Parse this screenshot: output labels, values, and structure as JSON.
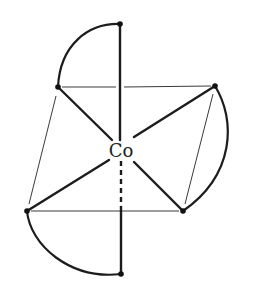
{
  "diagram": {
    "type": "octahedral coordination complex",
    "center_atom": {
      "label": "Co",
      "x": 121,
      "y": 151
    },
    "ligand_atoms": [
      {
        "id": "top",
        "x": 120,
        "y": 24
      },
      {
        "id": "upper-left",
        "x": 58,
        "y": 87
      },
      {
        "id": "upper-right",
        "x": 215,
        "y": 86
      },
      {
        "id": "lower-left",
        "x": 27,
        "y": 211
      },
      {
        "id": "lower-right",
        "x": 183,
        "y": 211
      },
      {
        "id": "bottom",
        "x": 121,
        "y": 274
      }
    ],
    "chelate_arcs": [
      {
        "from": "top",
        "to": "upper-left"
      },
      {
        "from": "upper-right",
        "to": "lower-right"
      },
      {
        "from": "lower-left",
        "to": "bottom"
      }
    ],
    "colors": {
      "line": "#1c1c1c",
      "background": "#ffffff"
    }
  }
}
